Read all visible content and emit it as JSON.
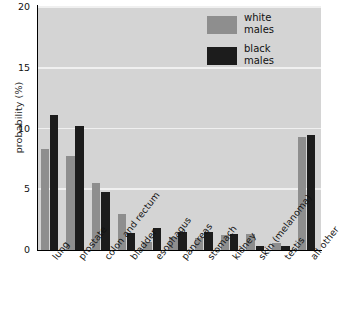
{
  "chart_data": {
    "type": "bar",
    "title": "",
    "subtitle": "",
    "xlabel": "",
    "ylabel": "probability (%)",
    "ylim": [
      0,
      20
    ],
    "yticks": [
      0,
      5,
      10,
      15,
      20
    ],
    "ytick_labels": [
      "0",
      "5",
      "10",
      "15",
      "20"
    ],
    "grid": "horizontal",
    "legend_position": "top-right",
    "categories": [
      "lung",
      "prostate",
      "colon and rectum",
      "bladder",
      "esophagus",
      "pancreas",
      "stomach",
      "kidney",
      "skin (melanoma)",
      "testis",
      "all other"
    ],
    "series": [
      {
        "name": "white males",
        "color": "#8e8e8e",
        "values": [
          8.3,
          7.7,
          5.5,
          3.0,
          0.7,
          1.1,
          1.0,
          1.2,
          1.3,
          0.6,
          9.3
        ]
      },
      {
        "name": "black males",
        "color": "#1c1c1c",
        "values": [
          11.1,
          10.2,
          4.8,
          1.4,
          1.8,
          1.5,
          1.5,
          1.3,
          0.3,
          0.3,
          9.5
        ]
      }
    ],
    "annotations": []
  },
  "legend": {
    "entries": [
      {
        "label_line1": "white",
        "label_line2": "males",
        "swatch": "#8e8e8e"
      },
      {
        "label_line1": "black",
        "label_line2": "males",
        "swatch": "#1c1c1c"
      }
    ]
  },
  "colors": {
    "plot_background": "#d4d4d4",
    "gridline": "#f0f0f0",
    "axis": "#000000",
    "text": "#111111",
    "white_males_bar": "#8e8e8e",
    "black_males_bar": "#1c1c1c"
  }
}
